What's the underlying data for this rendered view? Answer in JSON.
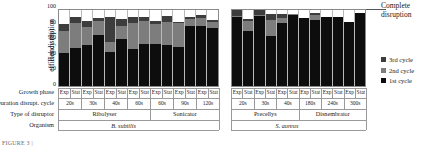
{
  "figure": {
    "y_axis_title_line1": "Rel disruption",
    "y_axis_title_line2": "efficiency (%)",
    "complete_disruption_line1": "Complete",
    "complete_disruption_line2": "disruption",
    "caption": "FIGURE 3 |"
  },
  "legend": {
    "position": "right",
    "items": [
      {
        "label": "3rd cycle",
        "color": "#3d3d3d"
      },
      {
        "label": "2nd cycle",
        "color": "#7d7d7d"
      },
      {
        "label": "1st cycle",
        "color": "#0d0d0d"
      }
    ]
  },
  "row_labels": [
    "Growth phase",
    "Duration disrupt. cycle",
    "Type of disruptor",
    "Organism"
  ],
  "chart_data": {
    "type": "bar",
    "subtype": "stacked",
    "title": "",
    "xlabel": "",
    "ylabel": "Rel disruption efficiency (%)",
    "ylim": [
      0,
      100
    ],
    "yticks": [
      0,
      20,
      40,
      60,
      80,
      100
    ],
    "grid": false,
    "reference_line": {
      "value": 100,
      "label": "Complete disruption"
    },
    "series": [
      {
        "name": "1st cycle",
        "color": "#0d0d0d"
      },
      {
        "name": "2nd cycle",
        "color": "#7d7d7d"
      },
      {
        "name": "3rd cycle",
        "color": "#3d3d3d"
      }
    ],
    "panels": [
      {
        "organism": "B. subtilis",
        "disruptor_groups": [
          {
            "name": "Ribolyser",
            "span": 8
          },
          {
            "name": "Sonicator",
            "span": 6
          }
        ],
        "durations": [
          {
            "label": "20s",
            "span": 2
          },
          {
            "label": "30s",
            "span": 2
          },
          {
            "label": "40s",
            "span": 2
          },
          {
            "label": "60s",
            "span": 2
          },
          {
            "label": "60s",
            "span": 2
          },
          {
            "label": "90s",
            "span": 2
          },
          {
            "label": "120s",
            "span": 2
          }
        ],
        "growth_phase": [
          "Exp",
          "Stat",
          "Exp",
          "Stat",
          "Exp",
          "Stat",
          "Exp",
          "Stat",
          "Exp",
          "Stat",
          "Exp",
          "Stat",
          "Exp",
          "Stat"
        ],
        "bars": [
          {
            "first": 42,
            "second": 28,
            "third": 9
          },
          {
            "first": 49,
            "second": 32,
            "third": 7
          },
          {
            "first": 52,
            "second": 24,
            "third": 7
          },
          {
            "first": 65,
            "second": 18,
            "third": 4
          },
          {
            "first": 43,
            "second": 14,
            "third": 32
          },
          {
            "first": 60,
            "second": 17,
            "third": 9
          },
          {
            "first": 48,
            "second": 33,
            "third": 7
          },
          {
            "first": 54,
            "second": 30,
            "third": 4
          },
          {
            "first": 54,
            "second": 26,
            "third": 3
          },
          {
            "first": 53,
            "second": 29,
            "third": 8
          },
          {
            "first": 50,
            "second": 31,
            "third": 1
          },
          {
            "first": 77,
            "second": 9,
            "third": 2
          },
          {
            "first": 77,
            "second": 10,
            "third": 4
          },
          {
            "first": 75,
            "second": 7,
            "third": 3
          }
        ]
      },
      {
        "organism": "S. aureus",
        "disruptor_groups": [
          {
            "name": "Precellys",
            "span": 6
          },
          {
            "name": "Disnembrator",
            "span": 6
          }
        ],
        "durations": [
          {
            "label": "20s",
            "span": 2
          },
          {
            "label": "30s",
            "span": 2
          },
          {
            "label": "40s",
            "span": 2
          },
          {
            "label": "180s",
            "span": 2
          },
          {
            "label": "240s",
            "span": 2
          },
          {
            "label": "300s",
            "span": 2
          }
        ],
        "growth_phase": [
          "Exp",
          "Stat",
          "Exp",
          "Stat",
          "Exp",
          "Stat",
          "Exp",
          "Stat",
          "Exp",
          "Stat",
          "Exp",
          "Stat"
        ],
        "bars": [
          {
            "first": 88,
            "second": 2,
            "third": 7
          },
          {
            "first": 70,
            "second": 14,
            "third": 2
          },
          {
            "first": 91,
            "second": 1,
            "third": 7
          },
          {
            "first": 64,
            "second": 21,
            "third": 7
          },
          {
            "first": 81,
            "second": 6,
            "third": 5
          },
          {
            "first": 91,
            "second": 1,
            "third": 1
          },
          {
            "first": 87,
            "second": 0,
            "third": 0
          },
          {
            "first": 84,
            "second": 7,
            "third": 2
          },
          {
            "first": 89,
            "second": 0,
            "third": 0
          },
          {
            "first": 88,
            "second": 0,
            "third": 0
          },
          {
            "first": 82,
            "second": 0,
            "third": 0
          },
          {
            "first": 93,
            "second": 0,
            "third": 0
          }
        ]
      }
    ]
  }
}
